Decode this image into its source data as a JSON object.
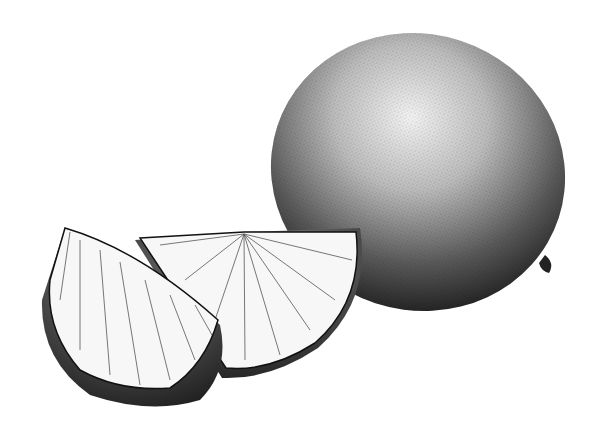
{
  "illustration": {
    "subject": "Stippled ink drawing of a whole citrus fruit with two cut wedges",
    "style": "black-and-white stipple / pen-and-ink",
    "background_color": "#ffffff",
    "ink_color": "#111111",
    "elements": [
      {
        "name": "whole-fruit",
        "description": "Oval whole lime/lemon, upper right"
      },
      {
        "name": "front-wedge",
        "description": "Wedge on the left, front"
      },
      {
        "name": "back-wedge",
        "description": "Wedge in the middle, behind the front wedge"
      }
    ]
  }
}
